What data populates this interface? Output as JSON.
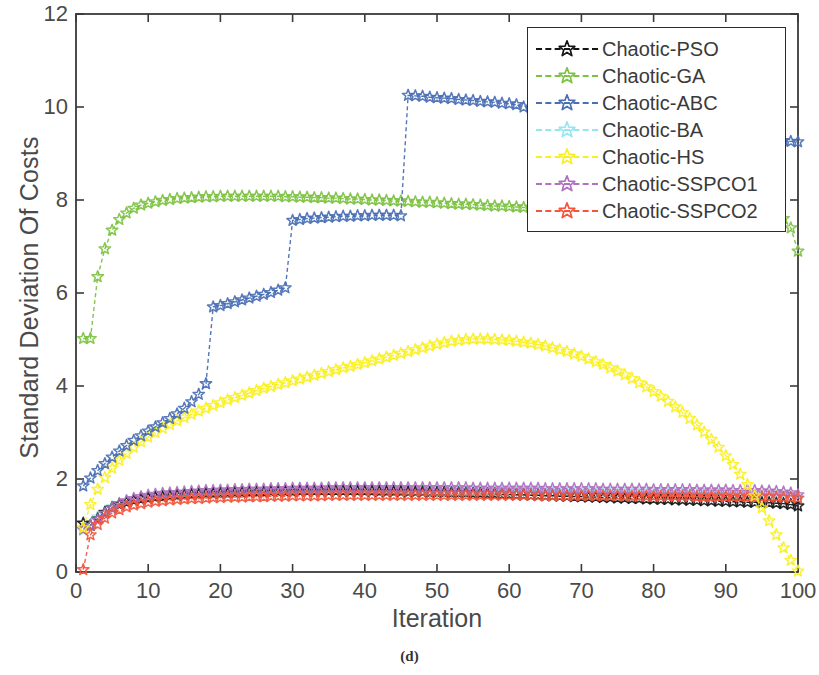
{
  "figure": {
    "caption": "(d)",
    "xlabel": "Iteration",
    "ylabel": "Standard Deviation Of Costs"
  },
  "legend": {
    "entries": [
      {
        "label": "Chaotic-PSO",
        "color": "#141414",
        "marker": "star-icon"
      },
      {
        "label": "Chaotic-GA",
        "color": "#7DC242",
        "marker": "star-icon"
      },
      {
        "label": "Chaotic-ABC",
        "color": "#4A6FB5",
        "marker": "star-icon"
      },
      {
        "label": "Chaotic-BA",
        "color": "#96E6F2",
        "marker": "star-icon"
      },
      {
        "label": "Chaotic-HS",
        "color": "#FAF020",
        "marker": "star-icon"
      },
      {
        "label": "Chaotic-SSPCO1",
        "color": "#B071BE",
        "marker": "star-icon"
      },
      {
        "label": "Chaotic-SSPCO2",
        "color": "#F4553C",
        "marker": "star-icon"
      }
    ]
  },
  "axes": {
    "x_ticks": [
      "0",
      "10",
      "20",
      "30",
      "40",
      "50",
      "60",
      "70",
      "80",
      "90",
      "100"
    ],
    "y_ticks": [
      "0",
      "2",
      "4",
      "6",
      "8",
      "10",
      "12"
    ]
  },
  "chart_data": {
    "type": "line",
    "title": "",
    "xlabel": "Iteration",
    "ylabel": "Standard Deviation Of Costs",
    "xlim": [
      0,
      100
    ],
    "ylim": [
      0,
      12
    ],
    "xticks": [
      0,
      10,
      20,
      30,
      40,
      50,
      60,
      70,
      80,
      90,
      100
    ],
    "yticks": [
      0,
      2,
      4,
      6,
      8,
      10,
      12
    ],
    "grid": false,
    "legend_position": "upper-right",
    "marker": "star (pentagram)",
    "linestyle": "dashed",
    "x": [
      1,
      2,
      3,
      4,
      5,
      6,
      7,
      8,
      9,
      10,
      11,
      12,
      13,
      14,
      15,
      16,
      17,
      18,
      19,
      20,
      21,
      22,
      23,
      24,
      25,
      26,
      27,
      28,
      29,
      30,
      31,
      32,
      33,
      34,
      35,
      36,
      37,
      38,
      39,
      40,
      41,
      42,
      43,
      44,
      45,
      46,
      47,
      48,
      49,
      50,
      51,
      52,
      53,
      54,
      55,
      56,
      57,
      58,
      59,
      60,
      61,
      62,
      63,
      64,
      65,
      66,
      67,
      68,
      69,
      70,
      71,
      72,
      73,
      74,
      75,
      76,
      77,
      78,
      79,
      80,
      81,
      82,
      83,
      84,
      85,
      86,
      87,
      88,
      89,
      90,
      91,
      92,
      93,
      94,
      95,
      96,
      97,
      98,
      99,
      100
    ],
    "series": [
      {
        "name": "Chaotic-PSO",
        "color": "#141414",
        "values": [
          1.05,
          1.0,
          1.14,
          1.28,
          1.38,
          1.45,
          1.5,
          1.54,
          1.57,
          1.59,
          1.61,
          1.62,
          1.64,
          1.65,
          1.66,
          1.67,
          1.68,
          1.69,
          1.69,
          1.7,
          1.7,
          1.71,
          1.71,
          1.72,
          1.72,
          1.72,
          1.73,
          1.73,
          1.73,
          1.73,
          1.74,
          1.74,
          1.74,
          1.74,
          1.74,
          1.74,
          1.74,
          1.74,
          1.74,
          1.74,
          1.74,
          1.73,
          1.73,
          1.73,
          1.73,
          1.72,
          1.72,
          1.72,
          1.71,
          1.71,
          1.71,
          1.7,
          1.7,
          1.7,
          1.69,
          1.69,
          1.68,
          1.68,
          1.67,
          1.67,
          1.66,
          1.66,
          1.65,
          1.65,
          1.64,
          1.64,
          1.63,
          1.63,
          1.62,
          1.62,
          1.61,
          1.61,
          1.6,
          1.6,
          1.59,
          1.59,
          1.58,
          1.58,
          1.57,
          1.57,
          1.56,
          1.56,
          1.55,
          1.55,
          1.54,
          1.54,
          1.53,
          1.53,
          1.52,
          1.52,
          1.51,
          1.51,
          1.5,
          1.5,
          1.49,
          1.49,
          1.48,
          1.47,
          1.45,
          1.42
        ]
      },
      {
        "name": "Chaotic-GA",
        "color": "#7DC242",
        "values": [
          5.02,
          5.02,
          6.35,
          6.95,
          7.35,
          7.58,
          7.72,
          7.82,
          7.89,
          7.93,
          7.96,
          7.99,
          8.01,
          8.03,
          8.04,
          8.05,
          8.06,
          8.07,
          8.07,
          8.08,
          8.08,
          8.08,
          8.08,
          8.08,
          8.08,
          8.08,
          8.08,
          8.08,
          8.07,
          8.07,
          8.06,
          8.06,
          8.05,
          8.05,
          8.04,
          8.04,
          8.03,
          8.02,
          8.02,
          8.01,
          8.0,
          8.0,
          7.99,
          7.98,
          7.98,
          7.97,
          7.96,
          7.95,
          7.95,
          7.94,
          7.93,
          7.92,
          7.91,
          7.91,
          7.9,
          7.89,
          7.88,
          7.87,
          7.87,
          7.86,
          7.85,
          7.84,
          7.84,
          7.83,
          7.82,
          7.82,
          7.81,
          7.8,
          7.8,
          7.79,
          7.79,
          7.78,
          7.78,
          7.77,
          7.77,
          7.76,
          7.76,
          7.75,
          7.75,
          7.74,
          7.74,
          7.73,
          7.73,
          7.72,
          7.72,
          7.71,
          7.71,
          7.7,
          7.7,
          7.69,
          7.69,
          7.68,
          7.68,
          7.67,
          7.66,
          7.65,
          7.64,
          7.6,
          7.4,
          6.9
        ]
      },
      {
        "name": "Chaotic-ABC",
        "color": "#4A6FB5",
        "values": [
          1.85,
          2.02,
          2.18,
          2.33,
          2.47,
          2.6,
          2.72,
          2.83,
          2.93,
          3.03,
          3.12,
          3.21,
          3.3,
          3.4,
          3.52,
          3.66,
          3.82,
          4.05,
          5.7,
          5.73,
          5.77,
          5.81,
          5.85,
          5.89,
          5.93,
          5.97,
          6.01,
          6.06,
          6.11,
          7.56,
          7.58,
          7.6,
          7.61,
          7.62,
          7.63,
          7.64,
          7.65,
          7.65,
          7.66,
          7.66,
          7.67,
          7.67,
          7.67,
          7.67,
          7.66,
          10.25,
          10.24,
          10.23,
          10.21,
          10.2,
          10.19,
          10.18,
          10.16,
          10.15,
          10.14,
          10.12,
          10.11,
          10.1,
          10.08,
          10.07,
          10.05,
          10.0,
          9.98,
          9.96,
          9.94,
          9.92,
          9.9,
          9.88,
          9.86,
          9.84,
          9.82,
          9.8,
          9.78,
          9.76,
          9.74,
          9.72,
          9.7,
          9.68,
          9.66,
          9.64,
          9.62,
          9.6,
          9.58,
          9.56,
          9.54,
          9.52,
          9.5,
          9.48,
          9.46,
          9.44,
          9.42,
          9.4,
          9.38,
          9.36,
          9.34,
          9.32,
          9.3,
          9.28,
          9.26,
          9.25
        ]
      },
      {
        "name": "Chaotic-BA",
        "color": "#96E6F2",
        "values": [
          0.9,
          1.02,
          1.18,
          1.3,
          1.4,
          1.47,
          1.52,
          1.56,
          1.59,
          1.61,
          1.63,
          1.64,
          1.66,
          1.67,
          1.68,
          1.69,
          1.7,
          1.7,
          1.71,
          1.71,
          1.72,
          1.72,
          1.73,
          1.73,
          1.73,
          1.74,
          1.74,
          1.74,
          1.74,
          1.74,
          1.75,
          1.75,
          1.75,
          1.75,
          1.75,
          1.75,
          1.75,
          1.75,
          1.75,
          1.75,
          1.75,
          1.75,
          1.75,
          1.75,
          1.75,
          1.75,
          1.74,
          1.74,
          1.74,
          1.74,
          1.74,
          1.74,
          1.74,
          1.73,
          1.73,
          1.73,
          1.73,
          1.73,
          1.73,
          1.72,
          1.72,
          1.72,
          1.72,
          1.72,
          1.71,
          1.71,
          1.71,
          1.71,
          1.7,
          1.7,
          1.7,
          1.7,
          1.7,
          1.69,
          1.69,
          1.69,
          1.69,
          1.68,
          1.68,
          1.68,
          1.68,
          1.67,
          1.67,
          1.67,
          1.67,
          1.66,
          1.66,
          1.66,
          1.66,
          1.65,
          1.65,
          1.65,
          1.65,
          1.64,
          1.64,
          1.64,
          1.63,
          1.62,
          1.6,
          1.58
        ]
      },
      {
        "name": "Chaotic-HS",
        "color": "#FAF020",
        "values": [
          0.95,
          1.45,
          1.78,
          2.03,
          2.23,
          2.4,
          2.55,
          2.68,
          2.8,
          2.9,
          3.0,
          3.09,
          3.17,
          3.25,
          3.32,
          3.39,
          3.46,
          3.52,
          3.58,
          3.64,
          3.7,
          3.75,
          3.8,
          3.85,
          3.9,
          3.95,
          3.99,
          4.03,
          4.07,
          4.11,
          4.15,
          4.19,
          4.23,
          4.27,
          4.31,
          4.35,
          4.39,
          4.42,
          4.46,
          4.5,
          4.54,
          4.58,
          4.62,
          4.66,
          4.7,
          4.74,
          4.78,
          4.82,
          4.86,
          4.9,
          4.93,
          4.96,
          4.98,
          5.0,
          5.01,
          5.01,
          5.01,
          5.0,
          4.99,
          4.98,
          4.96,
          4.94,
          4.92,
          4.89,
          4.86,
          4.82,
          4.78,
          4.74,
          4.69,
          4.64,
          4.58,
          4.52,
          4.46,
          4.39,
          4.32,
          4.24,
          4.16,
          4.07,
          3.98,
          3.88,
          3.78,
          3.67,
          3.55,
          3.43,
          3.3,
          3.16,
          3.01,
          2.85,
          2.68,
          2.5,
          2.31,
          2.1,
          1.88,
          1.64,
          1.38,
          1.1,
          0.8,
          0.52,
          0.25,
          0.02
        ]
      },
      {
        "name": "Chaotic-SSPCO1",
        "color": "#B071BE",
        "values": [
          0.92,
          1.0,
          1.12,
          1.26,
          1.38,
          1.47,
          1.53,
          1.58,
          1.62,
          1.65,
          1.67,
          1.69,
          1.7,
          1.71,
          1.72,
          1.73,
          1.74,
          1.75,
          1.75,
          1.76,
          1.76,
          1.77,
          1.77,
          1.78,
          1.78,
          1.78,
          1.79,
          1.79,
          1.79,
          1.8,
          1.8,
          1.8,
          1.8,
          1.8,
          1.81,
          1.81,
          1.81,
          1.81,
          1.81,
          1.81,
          1.81,
          1.81,
          1.81,
          1.81,
          1.81,
          1.81,
          1.81,
          1.81,
          1.81,
          1.81,
          1.81,
          1.81,
          1.81,
          1.81,
          1.8,
          1.8,
          1.8,
          1.8,
          1.8,
          1.8,
          1.8,
          1.8,
          1.8,
          1.8,
          1.79,
          1.79,
          1.79,
          1.79,
          1.79,
          1.79,
          1.79,
          1.79,
          1.78,
          1.78,
          1.78,
          1.78,
          1.78,
          1.78,
          1.78,
          1.77,
          1.77,
          1.77,
          1.77,
          1.77,
          1.77,
          1.76,
          1.76,
          1.76,
          1.76,
          1.76,
          1.75,
          1.75,
          1.75,
          1.75,
          1.74,
          1.74,
          1.73,
          1.72,
          1.7,
          1.66
        ]
      },
      {
        "name": "Chaotic-SSPCO2",
        "color": "#F4553C",
        "values": [
          0.05,
          0.8,
          1.02,
          1.16,
          1.27,
          1.34,
          1.4,
          1.44,
          1.47,
          1.5,
          1.52,
          1.53,
          1.55,
          1.56,
          1.57,
          1.58,
          1.58,
          1.59,
          1.6,
          1.6,
          1.61,
          1.61,
          1.61,
          1.62,
          1.62,
          1.62,
          1.63,
          1.63,
          1.63,
          1.64,
          1.64,
          1.64,
          1.64,
          1.64,
          1.65,
          1.65,
          1.65,
          1.65,
          1.65,
          1.65,
          1.65,
          1.65,
          1.65,
          1.65,
          1.65,
          1.65,
          1.65,
          1.65,
          1.65,
          1.65,
          1.65,
          1.65,
          1.65,
          1.65,
          1.65,
          1.65,
          1.65,
          1.65,
          1.65,
          1.65,
          1.65,
          1.65,
          1.65,
          1.64,
          1.64,
          1.64,
          1.64,
          1.64,
          1.64,
          1.64,
          1.64,
          1.64,
          1.64,
          1.64,
          1.64,
          1.63,
          1.63,
          1.63,
          1.63,
          1.63,
          1.63,
          1.63,
          1.63,
          1.63,
          1.63,
          1.62,
          1.62,
          1.62,
          1.62,
          1.62,
          1.62,
          1.62,
          1.62,
          1.61,
          1.61,
          1.61,
          1.61,
          1.6,
          1.6,
          1.59
        ]
      }
    ]
  }
}
